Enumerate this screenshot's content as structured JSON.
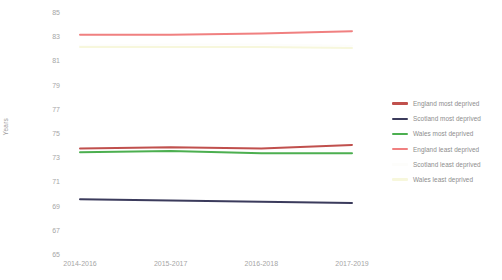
{
  "chart_data": {
    "type": "line",
    "title": "",
    "xlabel": "",
    "ylabel": "Years",
    "categories": [
      "2014-2016",
      "2015-2017",
      "2016-2018",
      "2017-2019"
    ],
    "ylim": [
      65,
      85
    ],
    "yticks": [
      85,
      83,
      81,
      79,
      77,
      75,
      73,
      71,
      69,
      67,
      65
    ],
    "grid": false,
    "legend_position": "right",
    "series": [
      {
        "name": "England most deprived",
        "color": "#c0504d",
        "values": [
          73.8,
          73.9,
          73.8,
          74.1
        ]
      },
      {
        "name": "Scotland most deprived",
        "color": "#3b3b5c",
        "values": [
          69.6,
          69.5,
          69.4,
          69.3
        ]
      },
      {
        "name": "Wales most deprived",
        "color": "#4caf50",
        "values": [
          73.5,
          73.6,
          73.4,
          73.4
        ]
      },
      {
        "name": "England least deprived",
        "color": "#f08080",
        "values": [
          83.2,
          83.2,
          83.3,
          83.5
        ]
      },
      {
        "name": "Scotland least deprived",
        "color": "#fdfdfb",
        "values": [
          82.3,
          82.4,
          82.4,
          82.3
        ]
      },
      {
        "name": "Wales least deprived",
        "color": "#f7f7dc",
        "values": [
          82.2,
          82.2,
          82.2,
          82.1
        ]
      }
    ]
  },
  "axis": {
    "y_label": "Years",
    "y_ticks": [
      "85",
      "83",
      "81",
      "79",
      "77",
      "75",
      "73",
      "71",
      "69",
      "67",
      "65"
    ],
    "x_ticks": [
      "2014-2016",
      "2015-2017",
      "2016-2018",
      "2017-2019"
    ]
  },
  "legend": {
    "items": [
      {
        "label": "England most deprived",
        "color": "#c0504d"
      },
      {
        "label": "Scotland most deprived",
        "color": "#3b3b5c"
      },
      {
        "label": "Wales most deprived",
        "color": "#4caf50"
      },
      {
        "label": "England least deprived",
        "color": "#f08080"
      },
      {
        "label": "Scotland least deprived",
        "color": "#fdfdfb"
      },
      {
        "label": "Wales least deprived",
        "color": "#f7f7dc"
      }
    ]
  }
}
